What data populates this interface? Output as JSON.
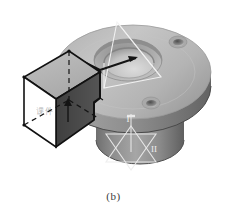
{
  "figure": {
    "caption": "(b)",
    "watermark": "课件",
    "background_color": "#ffffff"
  },
  "labels": {
    "plane_one": "I",
    "plane_two": "II"
  },
  "colors": {
    "background": "#ffffff",
    "flange_top": "#b9b9b9",
    "flange_top_light": "#c9c9c9",
    "flange_rim_side": "#8d8d8d",
    "flange_rim_dark": "#6f6f6f",
    "bore_counterbore": "#a2a2a2",
    "bore_inner": "#cfcfcf",
    "bore_shadow": "#7a7a7a",
    "boss_cylinder": "#9a9a9a",
    "boss_cylinder_dark": "#6a6a6a",
    "boss_bottom": "#858585",
    "prism_top_face": "#b5b5b5",
    "prism_right_face": "#4a4a4a",
    "prism_front_face": "#ffffff",
    "outline": "#111111",
    "wireframe": "#f2f2f2",
    "hole_dark": "#5c5c5c",
    "hole_light": "#cdcdcd",
    "caption_text": "#3a3a3a"
  },
  "geometry": {
    "flange": {
      "center_x": 133,
      "center_y": 72,
      "radius_x": 78,
      "radius_y": 47,
      "thickness": 16
    },
    "central_bore": {
      "center_x": 128,
      "center_y": 60,
      "counterbore_rx": 33,
      "counterbore_ry": 20,
      "bore_rx": 24,
      "bore_ry": 14
    },
    "boss": {
      "center_x": 140,
      "center_y": 105,
      "radius_x": 44,
      "radius_y": 24,
      "height": 52
    },
    "bolt_holes": [
      {
        "cx": 178,
        "cy": 42,
        "rx": 8,
        "ry": 5
      },
      {
        "cx": 151,
        "cy": 103,
        "rx": 8,
        "ry": 5
      }
    ],
    "prism": {
      "top_back": [
        69,
        51
      ],
      "top_left": [
        24,
        77
      ],
      "top_right": [
        100,
        72
      ],
      "top_front": [
        56,
        99
      ],
      "height": 48
    }
  },
  "annotations": {
    "leader_arrow": "arrow pointing to bore axis",
    "section_plane_one": "vertical section plane I",
    "section_plane_two": "inclined section plane II"
  }
}
